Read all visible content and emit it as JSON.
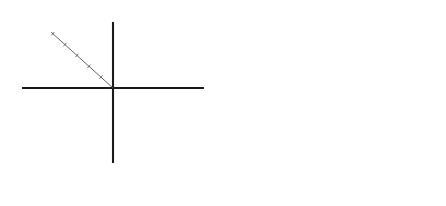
{
  "figure": {
    "background_color": "#ffffff",
    "axis_color": "#1a1a1a",
    "diagonal_axis_color": "#555555",
    "series_color": "#000000"
  },
  "panels": [
    {
      "id": "A",
      "caption": "A",
      "axis_labels": {
        "top_left": "Clan",
        "top_right": "Adhocracy",
        "bottom_left": "Hierarchy",
        "bottom_right": "Market"
      },
      "tick_values": [
        10,
        20,
        30,
        40,
        50
      ],
      "tick_labels": [
        "10",
        "20",
        "30",
        "40",
        "50"
      ],
      "chart_data": {
        "type": "radar",
        "title": "A",
        "categories": [
          "Clan",
          "Adhocracy",
          "Market",
          "Hierarchy"
        ],
        "values": [
          30,
          50,
          20,
          0
        ],
        "axis_order": [
          "Clan",
          "Adhocracy",
          "Market",
          "Hierarchy"
        ],
        "axis_directions": [
          "up-left",
          "up-right",
          "down-right",
          "down-left"
        ],
        "rmax": 50,
        "rticks": [
          10,
          20,
          30,
          40,
          50
        ],
        "grid": false,
        "legend": "none",
        "series": [
          {
            "name": "A",
            "values": [
              30,
              50,
              20,
              0
            ]
          }
        ]
      }
    },
    {
      "id": "B",
      "caption": "B",
      "axis_labels": {
        "top_left": "Clan",
        "top_right": "Adhocracy",
        "bottom_left": "Hierarchy",
        "bottom_right": "Market"
      },
      "tick_values": [
        10,
        20,
        30,
        40,
        50
      ],
      "tick_labels": [
        "10",
        "20",
        "30",
        "40",
        "50"
      ],
      "chart_data": {
        "type": "radar",
        "title": "B",
        "categories": [
          "Clan",
          "Adhocracy",
          "Market",
          "Hierarchy"
        ],
        "values": [
          30,
          30,
          40,
          0
        ],
        "axis_order": [
          "Clan",
          "Adhocracy",
          "Market",
          "Hierarchy"
        ],
        "axis_directions": [
          "up-left",
          "up-right",
          "down-right",
          "down-left"
        ],
        "rmax": 50,
        "rticks": [
          10,
          20,
          30,
          40,
          50
        ],
        "grid": false,
        "legend": "none",
        "series": [
          {
            "name": "B",
            "values": [
              30,
              30,
              40,
              0
            ]
          }
        ]
      }
    }
  ],
  "chart_data": [
    {
      "type": "radar",
      "title": "A",
      "categories": [
        "Clan",
        "Adhocracy",
        "Market",
        "Hierarchy"
      ],
      "values": [
        30,
        50,
        20,
        0
      ],
      "rmax": 50,
      "rticks": [
        10,
        20,
        30,
        40,
        50
      ],
      "xlabel": "",
      "ylabel": "",
      "grid": false,
      "legend": "none"
    },
    {
      "type": "radar",
      "title": "B",
      "categories": [
        "Clan",
        "Adhocracy",
        "Market",
        "Hierarchy"
      ],
      "values": [
        30,
        30,
        40,
        0
      ],
      "rmax": 50,
      "rticks": [
        10,
        20,
        30,
        40,
        50
      ],
      "xlabel": "",
      "ylabel": "",
      "grid": false,
      "legend": "none"
    }
  ]
}
